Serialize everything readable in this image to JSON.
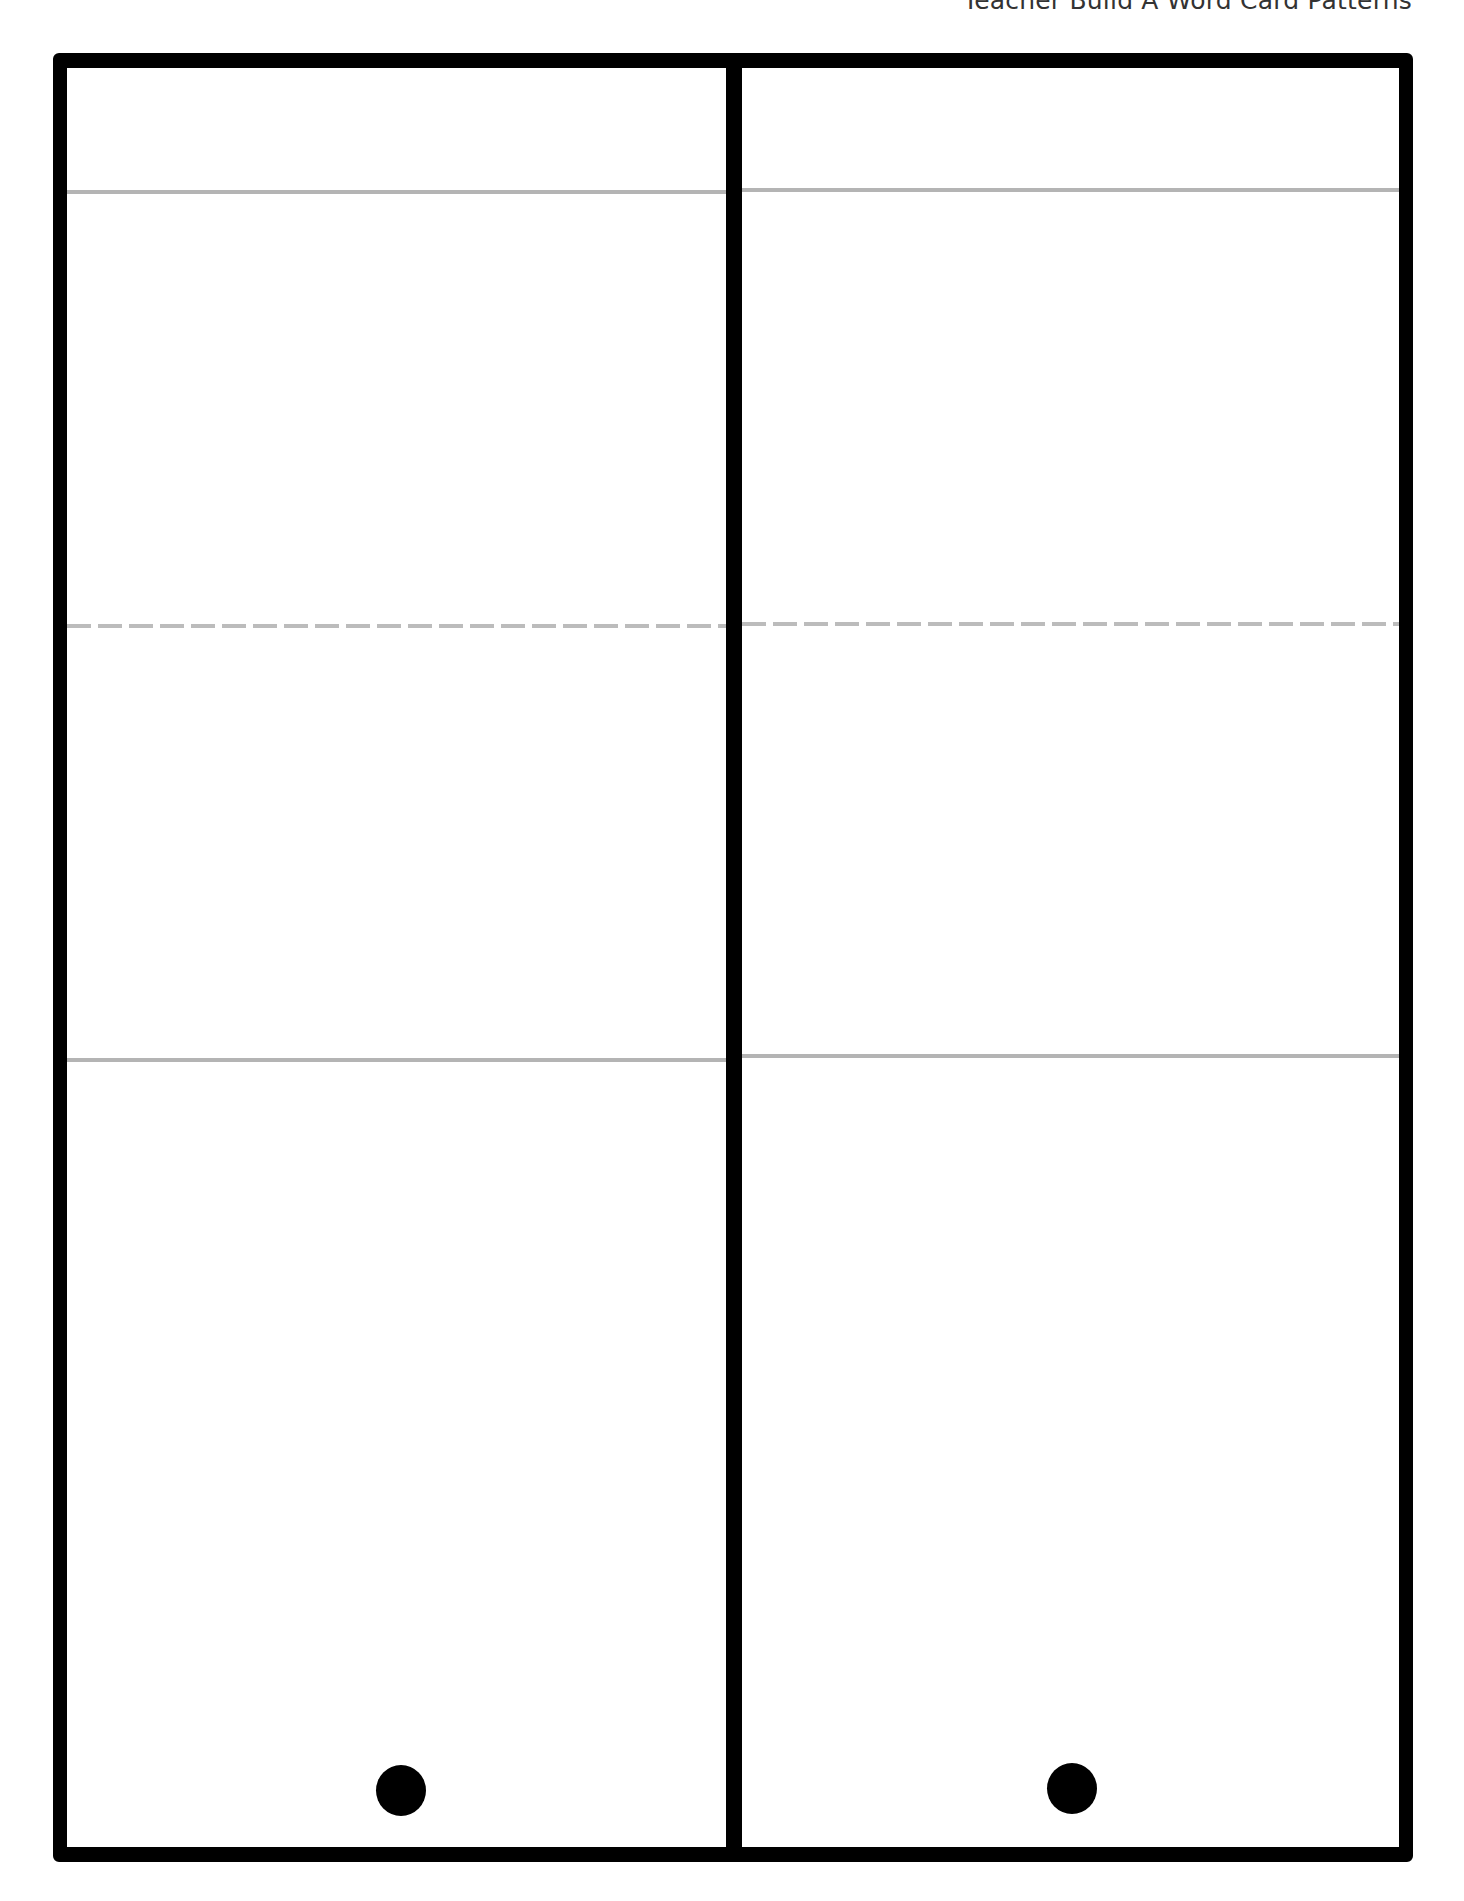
{
  "header": {
    "title": "Teacher Build A Word Card Patterns"
  },
  "colors": {
    "frame": "#000000",
    "guide_line": "#b4b4b4",
    "dashed_line": "#bcbcbc",
    "background": "#ffffff"
  },
  "cards": [
    {
      "id": "left",
      "rules": [
        "top-solid",
        "middle-dashed",
        "bottom-solid"
      ],
      "hole_punch": "dot"
    },
    {
      "id": "right",
      "rules": [
        "top-solid",
        "middle-dashed",
        "bottom-solid"
      ],
      "hole_punch": "dot"
    }
  ]
}
